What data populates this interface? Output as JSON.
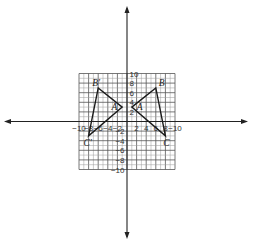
{
  "diagram": {
    "type": "coordinate-plane-reflection",
    "grid": {
      "xmin": -10,
      "xmax": 10,
      "ymin": -10,
      "ymax": 10,
      "step": 1,
      "major_step": 2
    },
    "axes": {
      "x_tick_labels": [
        {
          "value": -10,
          "text": "−10"
        },
        {
          "value": -8,
          "text": "−8"
        },
        {
          "value": -6,
          "text": "−6"
        },
        {
          "value": -4,
          "text": "−4"
        },
        {
          "value": -2,
          "text": "−2"
        },
        {
          "value": 2,
          "text": "2"
        },
        {
          "value": 4,
          "text": "4"
        },
        {
          "value": 6,
          "text": "6"
        },
        {
          "value": 8,
          "text": "8"
        },
        {
          "value": 10,
          "text": "−10"
        }
      ],
      "y_tick_labels": [
        {
          "value": 10,
          "text": "10"
        },
        {
          "value": 8,
          "text": "8"
        },
        {
          "value": 6,
          "text": "6"
        },
        {
          "value": 4,
          "text": "4"
        },
        {
          "value": 2,
          "text": "2"
        },
        {
          "value": -2,
          "text": "−2"
        },
        {
          "value": -4,
          "text": "−4"
        },
        {
          "value": -6,
          "text": "−6"
        },
        {
          "value": -8,
          "text": "−8"
        },
        {
          "value": -10,
          "text": "−10"
        }
      ]
    },
    "triangles": [
      {
        "name": "ABC",
        "vertices": [
          {
            "label": "A",
            "x": 1,
            "y": 3
          },
          {
            "label": "B",
            "x": 6,
            "y": 7
          },
          {
            "label": "C",
            "x": 8,
            "y": -3
          }
        ]
      },
      {
        "name": "A'B'C'",
        "vertices": [
          {
            "label": "A",
            "x": -1,
            "y": 3
          },
          {
            "label": "B′",
            "x": -6,
            "y": 7
          },
          {
            "label": "C′",
            "x": -8,
            "y": -3
          }
        ]
      }
    ],
    "colors": {
      "grid_minor": "#9a9a9a",
      "grid_major": "#555555",
      "axis": "#222222",
      "triangle": "#1a1a1a"
    }
  }
}
